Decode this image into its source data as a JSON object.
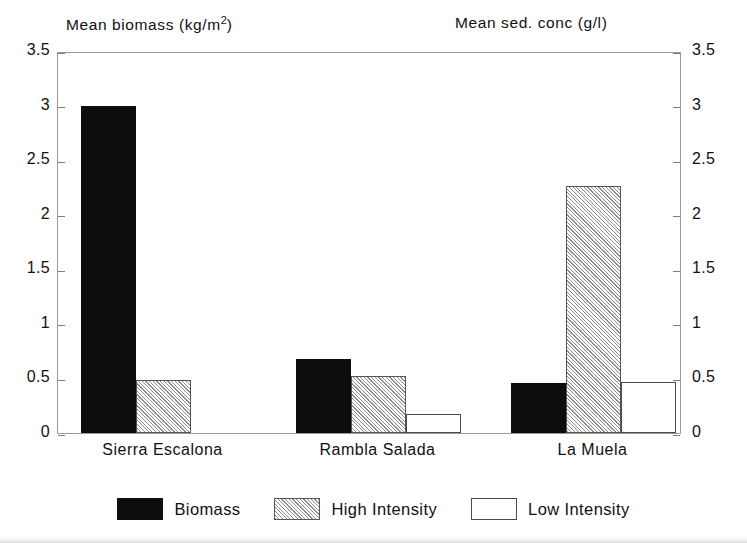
{
  "chart_data": {
    "type": "bar",
    "title": "",
    "categories": [
      "Sierra Escalona",
      "Rambla Salada",
      "La Muela"
    ],
    "series": [
      {
        "name": "Biomass",
        "axis": "left",
        "values": [
          3.0,
          0.68,
          0.46
        ]
      },
      {
        "name": "High Intensity",
        "axis": "right",
        "values": [
          0.49,
          0.52,
          2.26
        ]
      },
      {
        "name": "Low Intensity",
        "axis": "right",
        "values": [
          null,
          0.17,
          0.47
        ]
      }
    ],
    "left_axis": {
      "label": "Mean biomass (kg/m2)",
      "label_main": "Mean biomass  (kg/m",
      "label_sup": "2",
      "label_tail": ")",
      "ylim": [
        0,
        3.5
      ],
      "ticks": [
        "3.5",
        "3",
        "2.5",
        "2",
        "1.5",
        "1",
        "0.5",
        "0"
      ],
      "tick_values": [
        3.5,
        3,
        2.5,
        2,
        1.5,
        1,
        0.5,
        0
      ]
    },
    "right_axis": {
      "label": "Mean sed. conc  (g/l)",
      "ylim": [
        0,
        3.5
      ],
      "ticks": [
        "3.5",
        "3",
        "2.5",
        "2",
        "1.5",
        "1",
        "0.5",
        "0"
      ],
      "tick_values": [
        3.5,
        3,
        2.5,
        2,
        1.5,
        1,
        0.5,
        0
      ]
    },
    "xlabel": "",
    "grid": false,
    "legend": {
      "position": "bottom",
      "entries": [
        {
          "label": "Biomass",
          "style": "solid-black"
        },
        {
          "label": "High Intensity",
          "style": "diagonal-hatch"
        },
        {
          "label": "Low Intensity",
          "style": "white-outline"
        }
      ]
    },
    "colors": {
      "biomass": "#0d0d0d",
      "high_intensity_hatch": "#8d8d8d",
      "low_intensity": "#ffffff",
      "axis": "#9a9a9a",
      "text": "#111111"
    }
  }
}
